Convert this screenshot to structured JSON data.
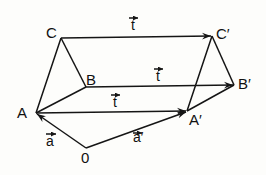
{
  "diagram": {
    "points": {
      "A": {
        "label": "A",
        "x": 36,
        "y": 113
      },
      "B": {
        "label": "B",
        "x": 86,
        "y": 87
      },
      "C": {
        "label": "C",
        "x": 61,
        "y": 38
      },
      "A_prime": {
        "label": "A′",
        "x": 187,
        "y": 111
      },
      "B_prime": {
        "label": "B′",
        "x": 234,
        "y": 85
      },
      "C_prime": {
        "label": "C′",
        "x": 212,
        "y": 36
      },
      "O": {
        "label": "0",
        "x": 86,
        "y": 148
      }
    },
    "vectors": {
      "t_top": {
        "label": "t",
        "from": "C",
        "to": "C_prime"
      },
      "t_mid": {
        "label": "t",
        "from": "B",
        "to": "B_prime"
      },
      "t_bottom": {
        "label": "t",
        "from": "A",
        "to": "A_prime"
      },
      "a": {
        "label": "a",
        "from": "O",
        "to": "A"
      },
      "a_prime": {
        "label": "a′",
        "from": "O",
        "to": "A_prime"
      }
    },
    "colors": {
      "line": "#151515",
      "background": "#fdfdfb"
    }
  }
}
